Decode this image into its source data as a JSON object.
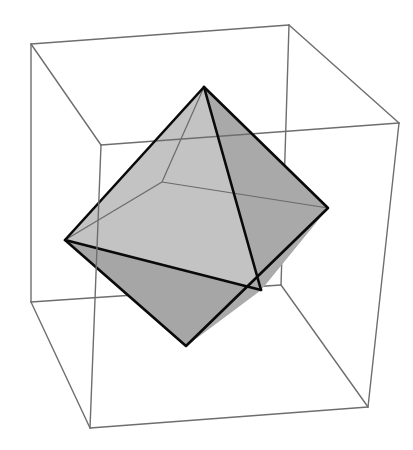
{
  "figure": {
    "width": 413,
    "height": 450,
    "background": "#ffffff"
  },
  "colors": {
    "box_edge": "#6e6e6e",
    "hidden_edge": "#6a6a6a",
    "octahedron_edge": "#0a0a0a",
    "face_top_left_front": "#c3c3c3",
    "face_top_front_right": "#a9a9a9",
    "face_left_front_bottom": "#a6a6a6",
    "face_front_right_bottom": "#ababab",
    "face_back_interior": "#c6c6c6"
  },
  "bounding_box": {
    "vertices": {
      "back_top_left": [
        31,
        44
      ],
      "back_top_right": [
        289,
        25
      ],
      "front_top_left": [
        101,
        145
      ],
      "front_top_right": [
        399,
        123
      ],
      "back_bottom_left": [
        31,
        302
      ],
      "back_bottom_right": [
        281,
        285
      ],
      "front_bottom_left": [
        90,
        428
      ],
      "front_bottom_right": [
        368,
        407
      ]
    }
  },
  "octahedron": {
    "vertices": {
      "top": [
        204,
        87
      ],
      "left": [
        65,
        240
      ],
      "right": [
        328,
        208
      ],
      "front": [
        261,
        290
      ],
      "back": [
        162,
        182
      ],
      "bottom": [
        186,
        346
      ]
    },
    "visible_faces": [
      [
        "top",
        "left",
        "front"
      ],
      [
        "top",
        "front",
        "right"
      ],
      [
        "left",
        "front",
        "bottom"
      ],
      [
        "front",
        "right",
        "bottom"
      ]
    ],
    "hidden_edges": [
      [
        "back",
        "top"
      ],
      [
        "back",
        "left"
      ],
      [
        "back",
        "right"
      ]
    ]
  }
}
